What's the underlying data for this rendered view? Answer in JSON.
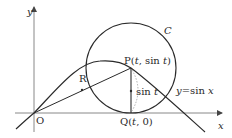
{
  "diagram": {
    "axes": {
      "x_label": "x",
      "y_label": "y",
      "origin_label": "O"
    },
    "curve": {
      "label": "y = sin x",
      "label_parts": {
        "y": "y",
        "eq": "=",
        "fn": "sin",
        "var": "x"
      }
    },
    "circle": {
      "label": "C"
    },
    "points": {
      "P": {
        "name": "P",
        "coords_open": "(",
        "t": "t",
        "sep": ", ",
        "fn": "sin",
        "t2": "t",
        "coords_close": ")"
      },
      "Q": {
        "name": "Q",
        "coords_open": "(",
        "t": "t",
        "rest": ", 0)"
      },
      "R": {
        "name": "R"
      }
    },
    "segment_label": {
      "fn": "sin",
      "var": "t"
    },
    "colors": {
      "stroke": "#2a2a2a",
      "axis": "#888888",
      "dashed": "#999999"
    }
  }
}
